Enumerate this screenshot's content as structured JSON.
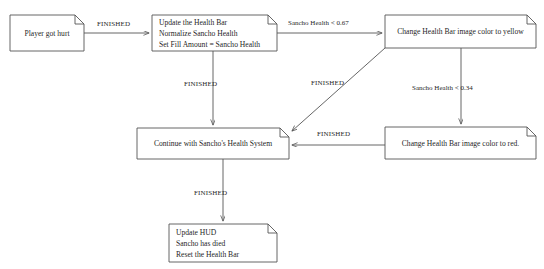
{
  "diagram": {
    "background_color": "#ffffff",
    "stroke_color": "#555555",
    "text_color": "#1f1f1f",
    "nodes": [
      {
        "id": "player-got-hurt",
        "name": "node-player-got-hurt",
        "lines": [
          "Player got hurt"
        ],
        "x": 10,
        "y": 15,
        "w": 74,
        "h": 36,
        "align": "center"
      },
      {
        "id": "update-health-bar",
        "name": "node-update-health-bar",
        "lines": [
          "Update the Health Bar",
          "Normalize Sancho Health",
          "Set Fill Amount = Sancho Health"
        ],
        "x": 152,
        "y": 15,
        "w": 125,
        "h": 36,
        "align": "left"
      },
      {
        "id": "yellow-bar",
        "name": "node-change-bar-yellow",
        "lines": [
          "Change Health Bar image color to yellow"
        ],
        "x": 385,
        "y": 15,
        "w": 151,
        "h": 33,
        "align": "center"
      },
      {
        "id": "red-bar",
        "name": "node-change-bar-red",
        "lines": [
          "Change Health Bar image color to red."
        ],
        "x": 385,
        "y": 127,
        "w": 151,
        "h": 32,
        "align": "center"
      },
      {
        "id": "continue-system",
        "name": "node-continue-health-system",
        "lines": [
          "Continue with Sancho's Health System"
        ],
        "x": 137,
        "y": 128,
        "w": 152,
        "h": 31,
        "align": "center"
      },
      {
        "id": "update-hud",
        "name": "node-update-hud",
        "lines": [
          "Update HUD",
          "Sancho has died",
          "Reset the Health Bar"
        ],
        "x": 169,
        "y": 224,
        "w": 108,
        "h": 38,
        "align": "left"
      }
    ],
    "edges": [
      {
        "id": "e1",
        "name": "edge-hurt-to-update",
        "from": "player-got-hurt",
        "to": "update-health-bar",
        "label": "FINISHED",
        "label_x": 97,
        "label_y": 20,
        "style": "caps"
      },
      {
        "id": "e2",
        "name": "edge-update-to-yellow",
        "from": "update-health-bar",
        "to": "yellow-bar",
        "label": "Sancho Health < 0.67",
        "label_x": 288,
        "label_y": 19,
        "style": "normal"
      },
      {
        "id": "e3",
        "name": "edge-update-to-continue",
        "from": "update-health-bar",
        "to": "continue-system",
        "label": "FINISHED",
        "label_x": 184,
        "label_y": 80,
        "style": "caps"
      },
      {
        "id": "e4",
        "name": "edge-yellow-to-red",
        "from": "yellow-bar",
        "to": "red-bar",
        "label": "Sancho Health < 0.34",
        "label_x": 412,
        "label_y": 84,
        "style": "normal"
      },
      {
        "id": "e5",
        "name": "edge-yellow-to-continue",
        "from": "yellow-bar",
        "to": "continue-system",
        "label": "FINISHED",
        "label_x": 311,
        "label_y": 79,
        "style": "caps"
      },
      {
        "id": "e6",
        "name": "edge-red-to-continue",
        "from": "red-bar",
        "to": "continue-system",
        "label": "FINISHED",
        "label_x": 317,
        "label_y": 130,
        "style": "caps"
      },
      {
        "id": "e7",
        "name": "edge-continue-to-hud",
        "from": "continue-system",
        "to": "update-hud",
        "label": "FINISHED",
        "label_x": 194,
        "label_y": 189,
        "style": "caps"
      }
    ]
  }
}
